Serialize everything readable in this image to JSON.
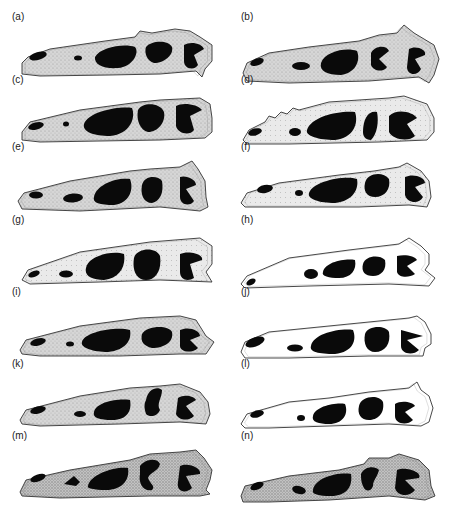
{
  "figure": {
    "colors": {
      "bone_shade": "#cfcfcf",
      "bone_light": "#f4f4f4",
      "outline": "#333333",
      "fenestra": "#0a0a0a",
      "background": "#ffffff"
    },
    "panels": [
      {
        "label": "(a)",
        "col": 0,
        "top": 25,
        "shade": "gray",
        "outline": "M22,52 L28,46 L50,38 L105,30 L135,26 L140,20 L152,22 L175,18 L190,20 L200,26 L212,34 L212,50 L205,58 L202,66 L196,60 L160,63 L110,64 L40,65 L22,63 Z",
        "holes": [
          {
            "type": "ellipse",
            "cx": 38,
            "cy": 45,
            "rx": 9,
            "ry": 4,
            "rot": -15
          },
          {
            "type": "ellipse",
            "cx": 78,
            "cy": 47,
            "rx": 4,
            "ry": 2.5,
            "rot": 0
          },
          {
            "type": "path",
            "d": "M95,46 C100,36 125,32 135,36 C140,42 132,56 118,57 C104,58 94,54 95,46 Z"
          },
          {
            "type": "path",
            "d": "M146,36 C150,30 168,28 172,36 C174,44 164,52 154,52 C147,50 144,42 146,36 Z"
          },
          {
            "type": "path",
            "d": "M184,34 C190,30 202,32 204,38 L194,44 L198,54 C194,60 184,58 184,50 Z"
          }
        ]
      },
      {
        "label": "(b)",
        "col": 1,
        "top": 25,
        "shade": "gray",
        "outline": "M14,62 L18,52 L40,42 L80,36 L130,30 L150,24 L168,22 L175,14 L185,22 L205,34 L210,48 L205,64 L200,72 L190,66 L140,70 L60,72 L18,70 Z",
        "holes": [
          {
            "type": "ellipse",
            "cx": 28,
            "cy": 51,
            "rx": 7,
            "ry": 3.5,
            "rot": -20
          },
          {
            "type": "ellipse",
            "cx": 72,
            "cy": 55,
            "rx": 9,
            "ry": 4,
            "rot": 0
          },
          {
            "type": "path",
            "d": "M92,52 C96,40 118,36 128,40 C132,50 126,62 112,64 C98,64 90,60 92,52 Z"
          },
          {
            "type": "path",
            "d": "M142,42 C146,34 158,34 160,40 L150,48 L158,56 C154,62 144,60 142,54 Z"
          },
          {
            "type": "path",
            "d": "M180,38 C186,34 198,38 196,44 L186,48 L192,58 C188,66 178,64 178,56 Z"
          }
        ]
      },
      {
        "label": "(c)",
        "col": 0,
        "top": 88,
        "shade": "gray",
        "outline": "M22,58 L30,48 L80,36 L140,28 L160,26 L200,24 L210,30 L212,44 L212,58 L205,64 L160,66 L40,68 L22,66 Z",
        "holes": [
          {
            "type": "ellipse",
            "cx": 36,
            "cy": 52,
            "rx": 8,
            "ry": 3.5,
            "rot": -15
          },
          {
            "type": "ellipse",
            "cx": 66,
            "cy": 50,
            "rx": 3,
            "ry": 2.5,
            "rot": 0
          },
          {
            "type": "path",
            "d": "M84,50 C88,38 118,32 132,34 C136,44 130,60 110,62 C94,62 82,58 84,50 Z"
          },
          {
            "type": "path",
            "d": "M138,36 C142,28 160,28 164,38 C166,48 158,58 148,58 C140,56 136,46 138,36 Z"
          },
          {
            "type": "path",
            "d": "M176,32 C182,28 198,30 202,36 L190,42 L194,56 C190,62 178,60 176,52 Z"
          }
        ]
      },
      {
        "label": "(d)",
        "col": 1,
        "top": 88,
        "shade": "light",
        "outline": "M14,66 L20,56 L36,48 L40,42 L46,44 L52,38 L58,40 L64,34 L70,36 L100,28 L160,24 L175,22 L198,30 L205,44 L205,58 L198,66 L150,68 L60,70 L18,70 Z",
        "holes": [
          {
            "type": "ellipse",
            "cx": 26,
            "cy": 58,
            "rx": 7,
            "ry": 3.5,
            "rot": -15
          },
          {
            "type": "ellipse",
            "cx": 66,
            "cy": 58,
            "rx": 6,
            "ry": 4,
            "rot": 0
          },
          {
            "type": "path",
            "d": "M78,56 C82,42 112,36 126,38 C130,50 124,64 106,66 C90,66 76,62 78,56 Z"
          },
          {
            "type": "path",
            "d": "M134,58 C134,44 140,36 148,38 C150,48 148,60 142,66 C136,66 134,62 134,58 Z"
          },
          {
            "type": "path",
            "d": "M160,42 C168,34 184,38 188,44 L178,50 L186,62 C180,68 164,66 160,58 Z"
          }
        ]
      },
      {
        "label": "(e)",
        "col": 0,
        "top": 155,
        "shade": "gray",
        "outline": "M18,60 L24,52 L70,40 L130,30 L150,28 L180,26 L192,20 L198,28 L205,40 L206,56 L208,66 L200,70 L160,66 L80,70 L22,68 Z",
        "holes": [
          {
            "type": "ellipse",
            "cx": 36,
            "cy": 54,
            "rx": 7,
            "ry": 3.5,
            "rot": 0
          },
          {
            "type": "ellipse",
            "cx": 73,
            "cy": 57,
            "rx": 10,
            "ry": 4.5,
            "rot": -5
          },
          {
            "type": "path",
            "d": "M94,56 C96,44 116,36 130,38 C134,48 130,62 114,64 C100,64 92,62 94,56 Z"
          },
          {
            "type": "path",
            "d": "M142,44 C144,34 158,34 162,40 C164,52 160,60 152,62 C144,62 140,54 142,44 Z"
          },
          {
            "type": "path",
            "d": "M180,36 C186,34 196,38 196,44 L186,48 L194,60 C190,66 180,64 180,56 Z"
          }
        ]
      },
      {
        "label": "(f)",
        "col": 1,
        "top": 155,
        "shade": "light",
        "outline": "M12,62 L18,52 L50,42 L110,34 L145,30 L170,26 L178,22 L192,30 L200,40 L202,56 L198,66 L180,64 L130,66 L60,66 L16,66 Z",
        "holes": [
          {
            "type": "ellipse",
            "cx": 36,
            "cy": 48,
            "rx": 8,
            "ry": 4,
            "rot": -10
          },
          {
            "type": "ellipse",
            "cx": 70,
            "cy": 52,
            "rx": 4,
            "ry": 3,
            "rot": 0
          },
          {
            "type": "path",
            "d": "M80,52 C84,40 116,34 128,38 C130,48 124,60 106,62 C90,62 78,58 80,52 Z"
          },
          {
            "type": "path",
            "d": "M136,42 C138,32 154,30 160,38 C162,48 156,56 146,56 C138,56 134,50 136,42 Z"
          },
          {
            "type": "path",
            "d": "M176,36 C184,32 196,36 196,42 L186,46 L194,56 C190,64 178,62 176,54 Z"
          }
        ]
      },
      {
        "label": "(g)",
        "col": 0,
        "top": 228,
        "shade": "half",
        "outline": "M22,66 L28,56 L80,38 L150,28 L200,24 L212,32 L212,50 L206,58 L212,68 L160,66 L100,68 L30,70 Z",
        "holes": [
          {
            "type": "ellipse",
            "cx": 34,
            "cy": 60,
            "rx": 6,
            "ry": 3,
            "rot": -20
          },
          {
            "type": "ellipse",
            "cx": 66,
            "cy": 60,
            "rx": 7,
            "ry": 3.5,
            "rot": 0
          },
          {
            "type": "path",
            "d": "M86,54 C88,42 112,36 124,40 C126,52 120,64 104,66 C92,66 84,62 86,54 Z"
          },
          {
            "type": "path",
            "d": "M134,44 C136,34 156,32 160,42 C162,56 156,66 146,66 C136,66 132,56 134,44 Z"
          },
          {
            "type": "path",
            "d": "M180,40 C188,36 204,40 202,46 L190,50 L194,64 C188,68 180,66 180,58 Z"
          }
        ]
      },
      {
        "label": "(h)",
        "col": 1,
        "top": 228,
        "shade": "white",
        "outline": "M12,70 L18,62 L60,44 L120,36 L170,30 L180,24 L192,32 L200,40 L200,50 L196,56 L206,64 L200,72 L160,70 L80,72 L16,74 Z",
        "holes": [
          {
            "type": "ellipse",
            "cx": 22,
            "cy": 68,
            "rx": 5,
            "ry": 3,
            "rot": -30
          },
          {
            "type": "ellipse",
            "cx": 82,
            "cy": 60,
            "rx": 7,
            "ry": 5,
            "rot": 0
          },
          {
            "type": "path",
            "d": "M94,58 C96,48 116,44 126,46 C128,56 122,64 110,64 C100,64 92,62 94,58 Z"
          },
          {
            "type": "path",
            "d": "M134,50 C136,42 150,40 156,46 C158,56 152,62 144,62 C136,62 132,58 134,50 Z"
          },
          {
            "type": "path",
            "d": "M168,42 C176,40 186,42 188,46 L178,52 L186,60 C180,64 170,64 168,58 Z"
          }
        ]
      },
      {
        "label": "(i)",
        "col": 0,
        "top": 300,
        "shade": "gray",
        "outline": "M20,64 L26,54 L80,40 L140,32 L180,30 L196,34 L206,50 L214,56 L210,62 L206,68 L180,68 L120,70 L40,70 L22,68 Z",
        "holes": [
          {
            "type": "ellipse",
            "cx": 38,
            "cy": 56,
            "rx": 8,
            "ry": 3.5,
            "rot": -15
          },
          {
            "type": "ellipse",
            "cx": 70,
            "cy": 58,
            "rx": 4,
            "ry": 2.5,
            "rot": 0
          },
          {
            "type": "path",
            "d": "M82,56 C84,46 116,40 130,44 C132,54 126,64 108,66 C94,66 80,62 82,56 Z"
          },
          {
            "type": "path",
            "d": "M142,48 C146,40 168,38 172,46 C174,56 164,62 152,62 C144,60 140,56 142,48 Z"
          },
          {
            "type": "path",
            "d": "M180,44 C188,40 200,44 200,50 L190,54 L198,62 C192,68 180,66 180,60 Z"
          }
        ]
      },
      {
        "label": "(j)",
        "col": 1,
        "top": 300,
        "shade": "white",
        "outline": "M12,66 L16,56 L40,46 L100,40 L140,36 L180,32 L188,30 L196,36 L202,48 L202,58 L196,62 L194,70 L140,70 L60,72 L16,72 Z",
        "holes": [
          {
            "type": "ellipse",
            "cx": 26,
            "cy": 56,
            "rx": 10,
            "ry": 4.5,
            "rot": -20
          },
          {
            "type": "ellipse",
            "cx": 66,
            "cy": 62,
            "rx": 8,
            "ry": 3.5,
            "rot": 0
          },
          {
            "type": "path",
            "d": "M82,60 C84,48 110,42 124,44 C128,54 124,66 106,68 C90,68 80,66 82,60 Z"
          },
          {
            "type": "path",
            "d": "M136,48 C138,40 156,38 160,46 C162,58 156,66 146,66 C138,66 134,58 136,48 Z"
          },
          {
            "type": "path",
            "d": "M172,44 L194,50 L178,54 L190,64 C184,70 172,68 172,60 Z"
          }
        ]
      },
      {
        "label": "(k)",
        "col": 0,
        "top": 372,
        "shade": "gray",
        "outline": "M20,62 L26,52 L80,38 L130,30 L160,28 L180,26 L200,34 L208,44 L210,56 L206,66 L180,64 L120,66 L40,68 L22,66 Z",
        "holes": [
          {
            "type": "ellipse",
            "cx": 38,
            "cy": 52,
            "rx": 8,
            "ry": 3.5,
            "rot": -15
          },
          {
            "type": "ellipse",
            "cx": 80,
            "cy": 56,
            "rx": 6,
            "ry": 3,
            "rot": 0
          },
          {
            "type": "path",
            "d": "M94,54 C96,44 118,40 130,42 C132,52 128,62 112,62 C100,62 92,60 94,54 Z"
          },
          {
            "type": "path",
            "d": "M146,42 C148,30 158,28 162,32 C162,40 156,46 160,52 C158,58 150,60 146,56 C144,50 144,46 146,42 Z"
          },
          {
            "type": "path",
            "d": "M178,40 C184,36 194,38 196,42 L186,48 L194,58 C188,64 178,62 176,56 Z"
          }
        ]
      },
      {
        "label": "(l)",
        "col": 1,
        "top": 372,
        "shade": "white",
        "outline": "M12,66 L18,56 L60,44 L100,40 L140,34 L180,30 L188,24 L192,32 L200,38 L204,50 L200,64 L192,68 L160,66 L100,68 L40,70 L16,70 Z",
        "holes": [
          {
            "type": "ellipse",
            "cx": 28,
            "cy": 56,
            "rx": 7,
            "ry": 3.5,
            "rot": -15
          },
          {
            "type": "ellipse",
            "cx": 72,
            "cy": 60,
            "rx": 4,
            "ry": 3,
            "rot": 0
          },
          {
            "type": "path",
            "d": "M84,58 C86,48 108,44 116,46 C120,56 114,66 100,66 C90,66 82,64 84,58 Z"
          },
          {
            "type": "path",
            "d": "M130,48 C132,38 150,36 154,44 C156,56 148,62 140,62 C132,62 128,56 130,48 Z"
          },
          {
            "type": "path",
            "d": "M166,46 C172,42 184,44 186,48 L176,54 L184,62 C178,68 166,66 166,58 Z"
          }
        ]
      },
      {
        "label": "(m)",
        "col": 0,
        "top": 444,
        "shade": "dark",
        "outline": "M20,62 L26,50 L70,40 L130,30 L150,24 L180,22 L196,20 L204,28 L212,40 L210,50 L206,60 L210,64 L200,66 L150,66 L60,68 L22,66 Z",
        "holes": [
          {
            "type": "ellipse",
            "cx": 38,
            "cy": 48,
            "rx": 8,
            "ry": 3.5,
            "rot": -20
          },
          {
            "type": "path",
            "d": "M64,54 L74,46 L80,52 L76,56 Z"
          },
          {
            "type": "path",
            "d": "M88,56 C90,44 116,36 128,38 C130,50 122,60 106,60 C94,60 86,58 88,56 Z"
          },
          {
            "type": "path",
            "d": "M140,36 C146,28 158,28 160,34 C158,42 150,42 148,48 C150,54 156,56 152,60 C144,62 138,54 140,44 Z"
          },
          {
            "type": "path",
            "d": "M180,36 C188,32 202,38 200,44 L186,46 L192,58 C186,64 176,62 178,52 Z"
          }
        ]
      },
      {
        "label": "(n)",
        "col": 1,
        "top": 444,
        "shade": "dark",
        "outline": "M12,66 L16,56 L60,46 L110,40 L135,34 L140,28 L160,28 L170,24 L190,30 L200,40 L202,56 L206,66 L196,70 L160,66 L100,70 L40,72 L14,72 Z",
        "holes": [
          {
            "type": "ellipse",
            "cx": 28,
            "cy": 56,
            "rx": 7,
            "ry": 3.5,
            "rot": -25
          },
          {
            "type": "ellipse",
            "cx": 70,
            "cy": 60,
            "rx": 7,
            "ry": 4,
            "rot": 15
          },
          {
            "type": "path",
            "d": "M84,60 C86,48 108,42 122,44 C124,56 118,66 102,66 C90,66 82,64 84,60 Z"
          },
          {
            "type": "path",
            "d": "M132,44 C136,36 146,36 150,40 C148,48 144,50 144,56 C142,62 136,62 134,56 C132,52 132,48 132,44 Z"
          },
          {
            "type": "path",
            "d": "M168,40 C176,36 194,42 190,48 L176,50 L186,60 C180,68 168,66 166,58 Z"
          }
        ]
      }
    ]
  }
}
